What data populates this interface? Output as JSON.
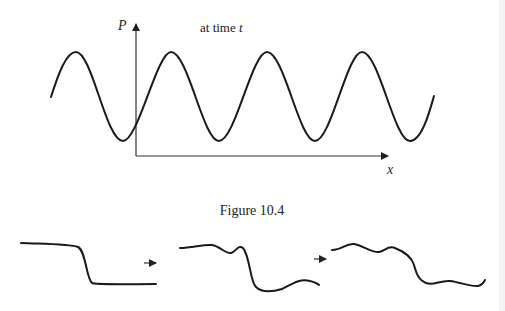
{
  "figure_top": {
    "y_axis_label": "P",
    "x_axis_label": "x",
    "annotation": "at time ",
    "annotation_var": "t",
    "caption": "Figure 10.4"
  },
  "figure_bottom": {
    "panels": [
      "initial step profile",
      "intermediate perturbed profile",
      "later perturbed profile"
    ],
    "arrows": [
      "→",
      "→"
    ]
  }
}
